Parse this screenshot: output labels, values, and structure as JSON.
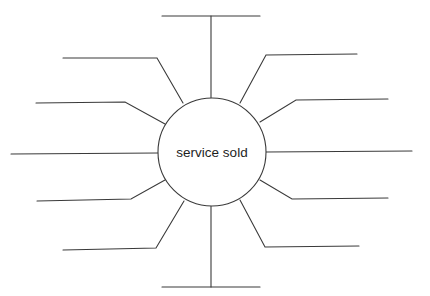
{
  "diagram": {
    "type": "spider-map",
    "center": {
      "label": "service sold",
      "cx": 212,
      "cy": 152,
      "r": 54
    },
    "stroke_color": "#3a3a3a",
    "spokes": [
      {
        "id": "top",
        "label": "",
        "points": [
          [
            211,
            98
          ],
          [
            211,
            16
          ]
        ],
        "bar": [
          [
            162,
            16
          ],
          [
            260,
            16
          ]
        ]
      },
      {
        "id": "upper-left-1",
        "label": "",
        "points": [
          [
            183,
            103
          ],
          [
            157,
            58
          ],
          [
            63,
            58
          ]
        ]
      },
      {
        "id": "upper-left-2",
        "label": "",
        "points": [
          [
            165,
            124
          ],
          [
            125,
            102
          ],
          [
            36,
            103
          ]
        ]
      },
      {
        "id": "left",
        "label": "",
        "points": [
          [
            158,
            153
          ],
          [
            11,
            154
          ]
        ]
      },
      {
        "id": "lower-left-1",
        "label": "",
        "points": [
          [
            165,
            180
          ],
          [
            131,
            199
          ],
          [
            37,
            201
          ]
        ]
      },
      {
        "id": "lower-left-2",
        "label": "",
        "points": [
          [
            184,
            201
          ],
          [
            156,
            248
          ],
          [
            63,
            250
          ]
        ]
      },
      {
        "id": "bottom",
        "label": "",
        "points": [
          [
            211,
            206
          ],
          [
            211,
            287
          ]
        ],
        "bar": [
          [
            162,
            287
          ],
          [
            260,
            287
          ]
        ]
      },
      {
        "id": "upper-right-1",
        "label": "",
        "points": [
          [
            240,
            103
          ],
          [
            266,
            55
          ],
          [
            357,
            54
          ]
        ]
      },
      {
        "id": "upper-right-2",
        "label": "",
        "points": [
          [
            260,
            122
          ],
          [
            296,
            100
          ],
          [
            388,
            99
          ]
        ]
      },
      {
        "id": "right",
        "label": "",
        "points": [
          [
            266,
            152
          ],
          [
            412,
            151
          ]
        ]
      },
      {
        "id": "lower-right-1",
        "label": "",
        "points": [
          [
            260,
            180
          ],
          [
            292,
            199
          ],
          [
            388,
            198
          ]
        ]
      },
      {
        "id": "lower-right-2",
        "label": "",
        "points": [
          [
            240,
            200
          ],
          [
            265,
            247
          ],
          [
            359,
            246
          ]
        ]
      }
    ]
  }
}
